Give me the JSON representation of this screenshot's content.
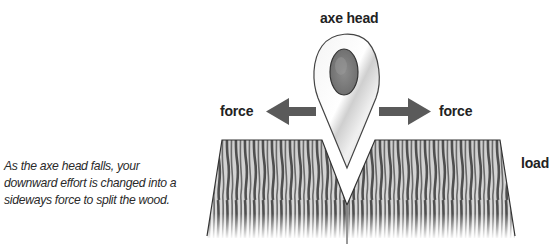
{
  "diagram": {
    "labels": {
      "axe_head": "axe head",
      "force_left": "force",
      "force_right": "force",
      "load": "load"
    },
    "caption": {
      "lines": [
        "As the axe head falls, your",
        "downward effort is changed into a",
        "sideways force to split the wood."
      ]
    },
    "icons": {
      "axe_head": "axe-head-wedge",
      "arrow_left": "left-arrow",
      "arrow_right": "right-arrow",
      "wood_block": "split-wood-log"
    },
    "colors": {
      "arrow": "#5a5a5a",
      "wood_grain": "#555555",
      "wood_bg": "#d8d8d8",
      "metal": "#e6e6e6",
      "handle": "#7a7a7a",
      "text": "#222222"
    }
  }
}
